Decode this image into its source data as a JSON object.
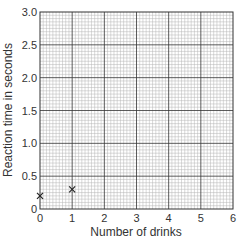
{
  "chart_data": {
    "type": "scatter",
    "title": "",
    "xlabel": "Number of drinks",
    "ylabel": "Reaction time in seconds",
    "xlim": [
      0,
      6
    ],
    "ylim": [
      0,
      3.0
    ],
    "x_ticks": [
      "0",
      "1",
      "2",
      "3",
      "4",
      "5",
      "6"
    ],
    "y_ticks": [
      "0",
      "0.5",
      "1.0",
      "1.5",
      "2.0",
      "2.5",
      "3.0"
    ],
    "grid": true,
    "grid_style": "graph paper: major lines every 1 drink / 0.5 s, minor lines every 0.1 drink / 0.05 s",
    "marker": "x",
    "series": [
      {
        "name": "Reaction time",
        "x": [
          0,
          1
        ],
        "y": [
          0.2,
          0.3
        ]
      }
    ]
  },
  "colors": {
    "major_grid": "#333333",
    "minor_grid": "#b5b5b5",
    "marker": "#222222",
    "text": "#333333"
  }
}
